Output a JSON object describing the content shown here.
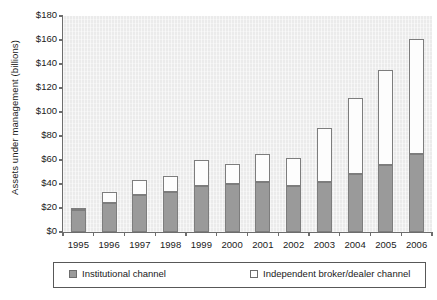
{
  "chart_data": {
    "type": "bar",
    "stacked": true,
    "title": "",
    "xlabel": "",
    "ylabel": "Assets under management (billions)",
    "ylim": [
      0,
      180
    ],
    "ytick_step": 20,
    "ytick_labels": [
      "$0",
      "$20",
      "$40",
      "$60",
      "$80",
      "$100",
      "$120",
      "$140",
      "$160",
      "$180"
    ],
    "ytick_values": [
      0,
      20,
      40,
      60,
      80,
      100,
      120,
      140,
      160,
      180
    ],
    "grid": false,
    "legend_position": "bottom",
    "categories": [
      "1995",
      "1996",
      "1997",
      "1998",
      "1999",
      "2000",
      "2001",
      "2002",
      "2003",
      "2004",
      "2005",
      "2006"
    ],
    "series": [
      {
        "name": "Institutional channel",
        "color": "#9a9a9a",
        "values": [
          18,
          24,
          31,
          33,
          38,
          40,
          42,
          38,
          42,
          48,
          56,
          65
        ]
      },
      {
        "name": "Independent broker/dealer channel",
        "color": "#ffffff",
        "values": [
          2,
          9,
          12,
          14,
          22,
          17,
          23,
          24,
          45,
          64,
          79,
          96
        ]
      }
    ],
    "totals": [
      20,
      33,
      43,
      47,
      60,
      57,
      65,
      62,
      87,
      112,
      135,
      161
    ]
  },
  "legend": {
    "items": [
      {
        "label": "Institutional channel",
        "swatch": "inst"
      },
      {
        "label": "Independent broker/dealer channel",
        "swatch": "indep"
      }
    ]
  }
}
